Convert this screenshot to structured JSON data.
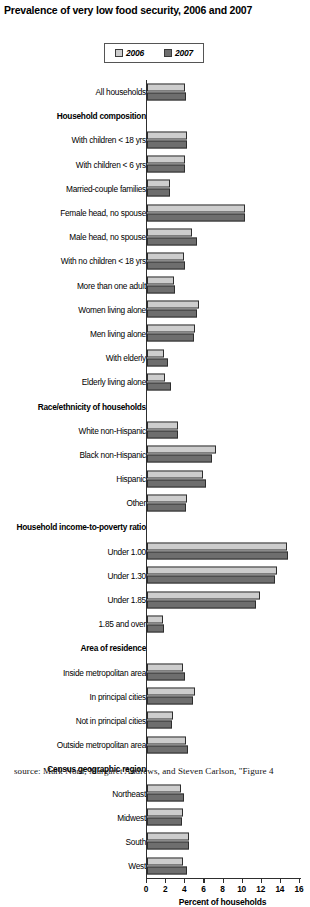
{
  "chart_data": {
    "type": "bar",
    "orientation": "horizontal",
    "title": "Prevalence of very low food security, 2006 and 2007",
    "xlabel": "Percent of households",
    "ylabel": "",
    "xlim": [
      0,
      16
    ],
    "xticks": [
      0,
      2,
      4,
      6,
      8,
      10,
      12,
      14,
      16
    ],
    "grid": false,
    "legend_position": "top-center",
    "legend": [
      "2006",
      "2007"
    ],
    "colors": {
      "series_2006": "#cdcdcd",
      "series_2007": "#6e6e6e",
      "outline": "#2e2e2e"
    },
    "categories": [
      "All households",
      "Household composition",
      "With children < 18 yrs",
      "With children < 6 yrs",
      "Married-couple families",
      "Female head, no spouse",
      "Male head, no spouse",
      "With no children < 18 yrs",
      "More than one adult",
      "Women living alone",
      "Men living alone",
      "With elderly",
      "Elderly living alone",
      "Race/ethnicity of households",
      "White non-Hispanic",
      "Black non-Hispanic",
      "Hispanic",
      "Other",
      "Household income-to-poverty ratio",
      "Under 1.00",
      "Under 1.30",
      "Under 1.85",
      "1.85 and over",
      "Area of residence",
      "Inside metropolitan area",
      "In principal cities",
      "Not in principal cities",
      "Outside metropolitan area",
      "Census geographic region",
      "Northeast",
      "Midwest",
      "South",
      "West"
    ],
    "group_headers": [
      "Household composition",
      "Race/ethnicity of households",
      "Household income-to-poverty ratio",
      "Area of residence",
      "Census geographic region"
    ],
    "series": [
      {
        "name": "2006",
        "values": [
          4.0,
          null,
          4.2,
          4.0,
          2.4,
          10.2,
          4.7,
          3.9,
          2.8,
          5.4,
          5.0,
          1.8,
          1.9,
          null,
          3.2,
          7.2,
          5.9,
          4.2,
          null,
          14.6,
          13.6,
          11.8,
          1.7,
          null,
          3.8,
          5.0,
          2.7,
          4.1,
          null,
          3.6,
          3.8,
          4.4,
          3.8
        ]
      },
      {
        "name": "2007",
        "values": [
          4.1,
          null,
          4.2,
          4.0,
          2.4,
          10.2,
          5.2,
          4.0,
          2.9,
          5.2,
          4.9,
          2.2,
          2.5,
          null,
          3.2,
          6.8,
          6.2,
          4.1,
          null,
          14.7,
          13.4,
          11.4,
          1.8,
          null,
          4.0,
          4.8,
          2.6,
          4.3,
          null,
          3.9,
          3.7,
          4.4,
          4.2
        ]
      }
    ]
  },
  "source_note": "source: Mark Nord, Margaret Andrews, and Steven Carlson, \"Figure 4"
}
